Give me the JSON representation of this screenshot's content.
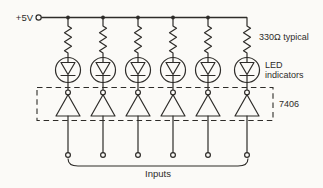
{
  "figure": {
    "type": "circuit-schematic",
    "channel_count": 6
  },
  "labels": {
    "supply_rail": "+5V",
    "resistor_value": "330Ω typical",
    "led_caption_line1": "LED",
    "led_caption_line2": "indicators",
    "ic_designator": "7406",
    "inputs_caption": "Inputs"
  },
  "components": {
    "supply_terminal": {
      "label": "+5V"
    },
    "resistors": {
      "count": 6,
      "value": "330Ω"
    },
    "leds": {
      "count": 6
    },
    "inverters": {
      "count": 6,
      "ic": "7406"
    },
    "input_terminals": {
      "count": 6
    }
  },
  "colors": {
    "ink": "#2e2c29",
    "background": "#fbfaf7"
  }
}
